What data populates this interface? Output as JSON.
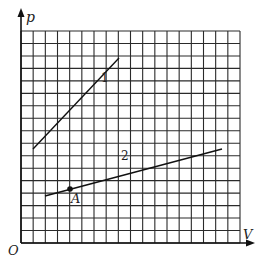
{
  "diagram": {
    "type": "p-V graph",
    "axes": {
      "y_label": "p",
      "x_label": "V",
      "origin_label": "O"
    },
    "grid": {
      "columns": 18,
      "rows": 17,
      "line_color": "#2a2a2a"
    },
    "lines": [
      {
        "label": "1",
        "from_px": [
          33,
          149
        ],
        "to_px": [
          119,
          58
        ]
      },
      {
        "label": "2",
        "from_px": [
          45,
          196
        ],
        "to_px": [
          222,
          149
        ]
      }
    ],
    "points": [
      {
        "label": "A",
        "px": [
          70,
          189
        ]
      }
    ]
  }
}
